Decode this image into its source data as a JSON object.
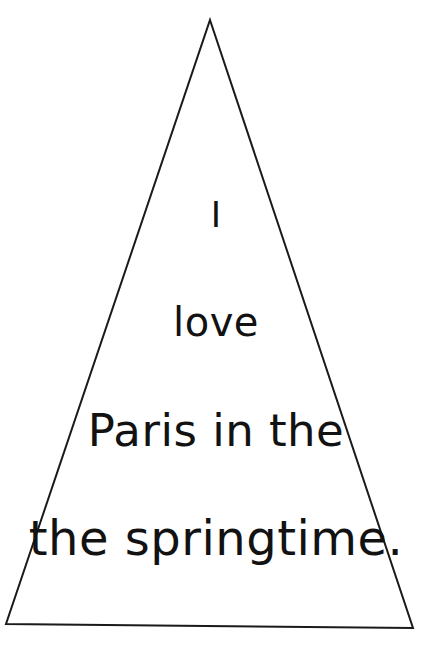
{
  "canvas": {
    "width": 432,
    "height": 657,
    "background_color": "#ffffff"
  },
  "figure": {
    "name": "triangle-outline",
    "shape": "triangle",
    "stroke_color": "#1a1a1a",
    "fill": "none",
    "stroke_width": 2,
    "apex": {
      "x": 210,
      "y": 20
    },
    "bottom_left": {
      "x": 6,
      "y": 624
    },
    "bottom_right": {
      "x": 413,
      "y": 628
    }
  },
  "text_block": {
    "align": "center",
    "color": "#121212",
    "lines": [
      {
        "text": "I",
        "font_size": 35,
        "baseline_y": 232
      },
      {
        "text": "love",
        "font_size": 40,
        "baseline_y": 341
      },
      {
        "text": "Paris in the",
        "font_size": 45,
        "baseline_y": 452
      },
      {
        "text": "the springtime.",
        "font_size": 48,
        "baseline_y": 561
      }
    ],
    "full_text": "I love Paris in the the springtime."
  }
}
